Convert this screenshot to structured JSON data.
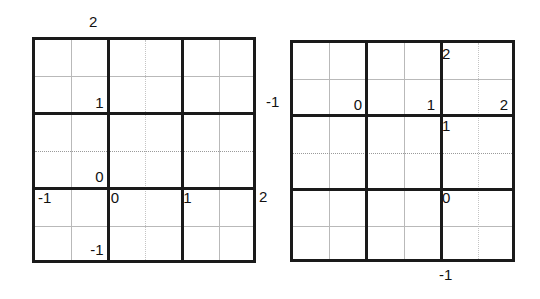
{
  "figure": {
    "kind": "two-sudoku-like-6x6-grids",
    "background_color": "#ffffff",
    "ink_color": "#1a1a1a",
    "thin_line_color": "#b9b9b9"
  },
  "left_grid": {
    "name": "left-grid",
    "columns": 6,
    "rows": 6,
    "blocks_x": 3,
    "blocks_y": 3,
    "entries": [
      {
        "row": 2,
        "col": 2,
        "value": "1",
        "align": "br"
      },
      {
        "row": 4,
        "col": 2,
        "value": "0",
        "align": "br"
      },
      {
        "row": 5,
        "col": 1,
        "value": "-1",
        "align": "tl"
      },
      {
        "row": 5,
        "col": 3,
        "value": "0",
        "align": "tl"
      },
      {
        "row": 5,
        "col": 5,
        "value": "1",
        "align": "tl"
      },
      {
        "row": 6,
        "col": 2,
        "value": "-1",
        "align": "br"
      }
    ],
    "outside_labels": [
      {
        "name": "left-grid-top-label",
        "value": "2",
        "side": "top"
      },
      {
        "name": "left-grid-right-label",
        "value": "2",
        "side": "right"
      }
    ]
  },
  "right_grid": {
    "name": "right-grid",
    "columns": 6,
    "rows": 6,
    "blocks_x": 3,
    "blocks_y": 3,
    "entries": [
      {
        "row": 1,
        "col": 5,
        "value": "2",
        "align": "tl"
      },
      {
        "row": 2,
        "col": 2,
        "value": "0",
        "align": "br"
      },
      {
        "row": 2,
        "col": 4,
        "value": "1",
        "align": "br"
      },
      {
        "row": 2,
        "col": 6,
        "value": "2",
        "align": "br"
      },
      {
        "row": 3,
        "col": 5,
        "value": "1",
        "align": "tl"
      },
      {
        "row": 5,
        "col": 5,
        "value": "0",
        "align": "tl"
      }
    ],
    "outside_labels": [
      {
        "name": "right-grid-left-label",
        "value": "-1",
        "side": "left"
      },
      {
        "name": "right-grid-bottom-label",
        "value": "-1",
        "side": "bottom"
      }
    ]
  },
  "cells": {
    "left": {
      "r2c2": "1",
      "r4c2": "0",
      "r5c1": "-1",
      "r5c3": "0",
      "r5c5": "1",
      "r6c2": "-1"
    },
    "right": {
      "r1c5": "2",
      "r2c2": "0",
      "r2c4": "1",
      "r2c6": "2",
      "r3c5": "1",
      "r5c5": "0"
    }
  },
  "labels": {
    "left_top": "2",
    "left_right": "2",
    "right_left": "-1",
    "right_bottom": "-1"
  }
}
